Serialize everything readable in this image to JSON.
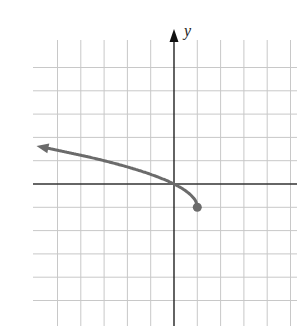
{
  "chart_data": {
    "type": "line",
    "title": "",
    "xlabel": "",
    "ylabel": "y",
    "xlim": [
      -6,
      5
    ],
    "ylim": [
      -6,
      5
    ],
    "grid": true,
    "grid_step": 1,
    "series": [
      {
        "name": "y = sqrt(1 - x) - 1",
        "x": [
          1,
          0.75,
          0.5,
          0,
          -1,
          -2,
          -3,
          -4,
          -5,
          -5.9
        ],
        "y": [
          -1,
          -0.5,
          -0.29,
          0,
          0.41,
          0.73,
          1,
          1.24,
          1.45,
          1.63
        ],
        "start_point": {
          "x": 1,
          "y": -1,
          "style": "closed-dot"
        },
        "end": "arrow-left",
        "color": "#6b6b6b"
      }
    ],
    "annotations": []
  },
  "colors": {
    "grid": "#c8c8c8",
    "axis": "#222222",
    "curve": "#6b6b6b"
  }
}
